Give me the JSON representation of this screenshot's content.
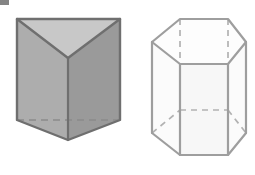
{
  "figure": {
    "background_color": "#ffffff",
    "width": 255,
    "height": 175,
    "artifact": {
      "name": "scan-artifact",
      "label": "",
      "color": "#6e6e6e",
      "x": 0,
      "y": 0,
      "width": 9,
      "height": 5
    }
  },
  "shapes": [
    {
      "id": "triangular-prism",
      "label": "Triangular prism",
      "style": "shaded-solid",
      "edge_color": "#6f6f6f",
      "hidden_edge_color": "#8a8a8a",
      "edge_width": 2,
      "faces": {
        "top": {
          "name": "top-face",
          "fill": "#c7c7c7",
          "points": "17,19 120,19 68,58"
        },
        "front_left": {
          "name": "front-left-face",
          "fill": "#adadad",
          "points": "17,19 68,58 68,140 17,120"
        },
        "front_right": {
          "name": "front-right-face",
          "fill": "#999999",
          "points": "120,19 120,120 68,140 68,58"
        },
        "bottom_left": {
          "name": "bottom-left-face",
          "fill": "#a6a6a6",
          "points": "17,120 68,140 68,140"
        }
      },
      "outline": "17,19 120,19 120,120 68,140 17,120",
      "visible_edges": [
        {
          "name": "top-left-diagonal",
          "x1": 17,
          "y1": 19,
          "x2": 68,
          "y2": 58
        },
        {
          "name": "top-right-diagonal",
          "x1": 120,
          "y1": 19,
          "x2": 68,
          "y2": 58
        },
        {
          "name": "front-vertical-edge",
          "x1": 68,
          "y1": 58,
          "x2": 68,
          "y2": 140
        },
        {
          "name": "bottom-left-edge",
          "x1": 17,
          "y1": 120,
          "x2": 68,
          "y2": 140
        },
        {
          "name": "bottom-right-edge",
          "x1": 120,
          "y1": 120,
          "x2": 68,
          "y2": 140
        }
      ],
      "hidden_edges": [
        {
          "name": "hidden-bottom-back-edge",
          "x1": 17,
          "y1": 120,
          "x2": 120,
          "y2": 120,
          "dash": "7,5"
        }
      ]
    },
    {
      "id": "hexagonal-prism",
      "label": "Hexagonal prism",
      "style": "wireframe-transparent",
      "edge_color": "#9e9e9e",
      "hidden_edge_color": "#b0b0b0",
      "edge_width": 2,
      "faces": {
        "body": {
          "name": "prism-body",
          "fill": "#fbfbfb",
          "points": "152,42 180,19 228,19 246,42 228,64 180,64"
        },
        "front": {
          "name": "front-face",
          "fill": "#f6f6f6",
          "points": "180,64 228,64 228,155 180,155"
        }
      },
      "top_hexagon": "152,42 180,19 228,19 246,42 228,64 180,64",
      "bottom_hexagon": "152,133 180,110 228,110 246,133 228,155 180,155",
      "visible_edges": [
        {
          "name": "top-front-left-edge",
          "x1": 152,
          "y1": 42,
          "x2": 180,
          "y2": 64
        },
        {
          "name": "top-front-edge",
          "x1": 180,
          "y1": 64,
          "x2": 228,
          "y2": 64
        },
        {
          "name": "top-front-right-edge",
          "x1": 228,
          "y1": 64,
          "x2": 246,
          "y2": 42
        },
        {
          "name": "top-back-left-edge",
          "x1": 152,
          "y1": 42,
          "x2": 180,
          "y2": 19
        },
        {
          "name": "top-back-edge",
          "x1": 180,
          "y1": 19,
          "x2": 228,
          "y2": 19
        },
        {
          "name": "top-back-right-edge",
          "x1": 228,
          "y1": 19,
          "x2": 246,
          "y2": 42
        },
        {
          "name": "vertical-edge-far-left",
          "x1": 152,
          "y1": 42,
          "x2": 152,
          "y2": 133
        },
        {
          "name": "vertical-edge-front-left",
          "x1": 180,
          "y1": 64,
          "x2": 180,
          "y2": 155
        },
        {
          "name": "vertical-edge-front-right",
          "x1": 228,
          "y1": 64,
          "x2": 228,
          "y2": 155
        },
        {
          "name": "vertical-edge-far-right",
          "x1": 246,
          "y1": 42,
          "x2": 246,
          "y2": 133
        },
        {
          "name": "bottom-front-left-edge",
          "x1": 152,
          "y1": 133,
          "x2": 180,
          "y2": 155
        },
        {
          "name": "bottom-front-edge",
          "x1": 180,
          "y1": 155,
          "x2": 228,
          "y2": 155
        },
        {
          "name": "bottom-front-right-edge",
          "x1": 228,
          "y1": 155,
          "x2": 246,
          "y2": 133
        }
      ],
      "hidden_edges": [
        {
          "name": "hidden-vertical-back-left",
          "x1": 180,
          "y1": 19,
          "x2": 180,
          "y2": 110,
          "dash": "6,5"
        },
        {
          "name": "hidden-vertical-back-right",
          "x1": 228,
          "y1": 19,
          "x2": 228,
          "y2": 110,
          "dash": "6,5"
        },
        {
          "name": "hidden-bottom-back-left-edge",
          "x1": 152,
          "y1": 133,
          "x2": 180,
          "y2": 110,
          "dash": "6,5"
        },
        {
          "name": "hidden-bottom-back-edge",
          "x1": 180,
          "y1": 110,
          "x2": 228,
          "y2": 110,
          "dash": "6,5"
        },
        {
          "name": "hidden-bottom-back-right-edge",
          "x1": 228,
          "y1": 110,
          "x2": 246,
          "y2": 133,
          "dash": "6,5"
        }
      ]
    }
  ]
}
